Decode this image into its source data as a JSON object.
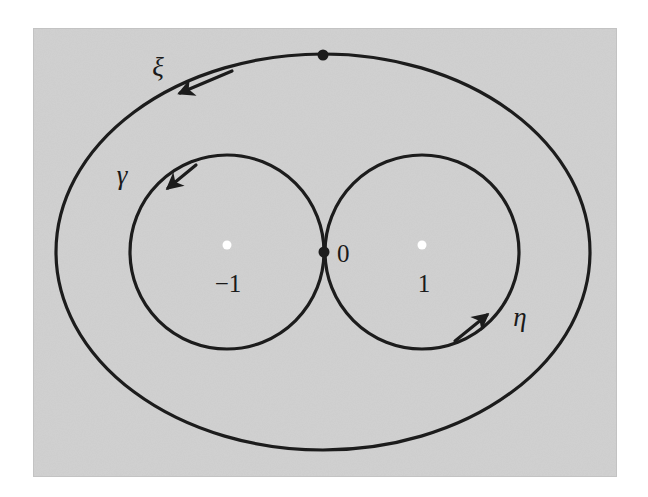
{
  "figure": {
    "kind": "complex-plane-loop-diagram",
    "canvas": {
      "width": 648,
      "height": 497
    },
    "panel": {
      "x": 33,
      "y": 28,
      "width": 584,
      "height": 449,
      "fill": "#d0d0d0",
      "border": "#c6c6c6"
    },
    "stroke_color": "#1c1c1c",
    "stroke_width": 3.2,
    "curves": [
      {
        "name": "outer-loop-xi",
        "label": "ξ",
        "label_x": 158,
        "label_y": 76,
        "shape": "ellipse",
        "cx": 323,
        "cy": 252,
        "rx": 267,
        "ry": 198,
        "orientation": "clockwise-from-top-left",
        "arrow_x": 178,
        "arrow_y": 95,
        "arrow_angle": 208
      },
      {
        "name": "left-loop-gamma",
        "label": "γ",
        "label_x": 122,
        "label_y": 184,
        "shape": "circle",
        "cx": 227,
        "cy": 252,
        "r": 97,
        "orientation": "clockwise-from-top-left",
        "arrow_x": 165,
        "arrow_y": 192,
        "arrow_angle": 215
      },
      {
        "name": "right-loop-eta",
        "label": "η",
        "label_x": 520,
        "label_y": 326,
        "shape": "circle",
        "cx": 422,
        "cy": 252,
        "r": 97,
        "orientation": "counterclockwise-from-bottom-right",
        "arrow_x": 484,
        "arrow_y": 313,
        "arrow_angle": 325
      }
    ],
    "points": [
      {
        "name": "basepoint-top",
        "x": 323,
        "y": 55,
        "radius": 5.5,
        "fill": "#1c1c1c",
        "label": "",
        "label_x": 0,
        "label_y": 0
      },
      {
        "name": "origin",
        "x": 324,
        "y": 252,
        "radius": 5.5,
        "fill": "#1c1c1c",
        "label": "0",
        "label_x": 337,
        "label_y": 262
      },
      {
        "name": "branch-point-minus-one",
        "x": 227,
        "y": 245,
        "radius": 4.5,
        "fill": "#ffffff",
        "label": "−1",
        "label_x": 228,
        "label_y": 292
      },
      {
        "name": "branch-point-one",
        "x": 422,
        "y": 245,
        "radius": 4.5,
        "fill": "#ffffff",
        "label": "1",
        "label_x": 424,
        "label_y": 292
      }
    ]
  }
}
